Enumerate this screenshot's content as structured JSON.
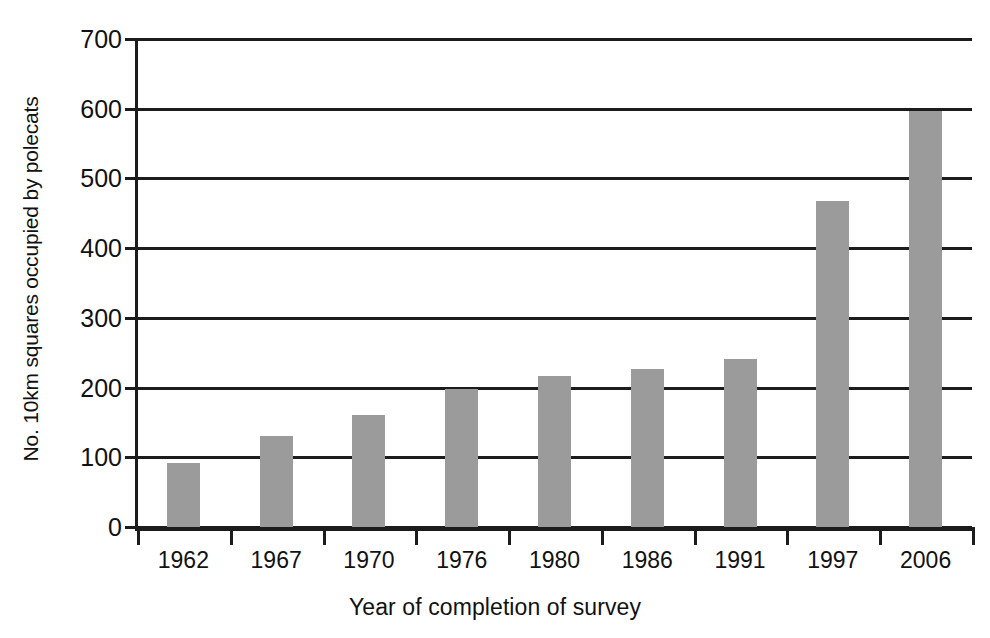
{
  "chart_data": {
    "type": "bar",
    "title": "",
    "subtitle": "",
    "xlabel": "Year of completion of survey",
    "ylabel": "No. 10km squares occupied by polecats",
    "categories": [
      "1962",
      "1967",
      "1970",
      "1976",
      "1980",
      "1986",
      "1991",
      "1997",
      "2006"
    ],
    "values": [
      92,
      131,
      161,
      198,
      216,
      226,
      241,
      468,
      597
    ],
    "ylim": [
      0,
      700
    ],
    "ytick_labels": [
      "0",
      "100",
      "200",
      "300",
      "400",
      "500",
      "600",
      "700"
    ],
    "ytick_values": [
      0,
      100,
      200,
      300,
      400,
      500,
      600,
      700
    ],
    "grid": "horizontal",
    "legend": "none",
    "bar_color": "#9b9b9b",
    "axis_color": "#1c1c1c",
    "background_color": "#ffffff",
    "annotations": []
  }
}
